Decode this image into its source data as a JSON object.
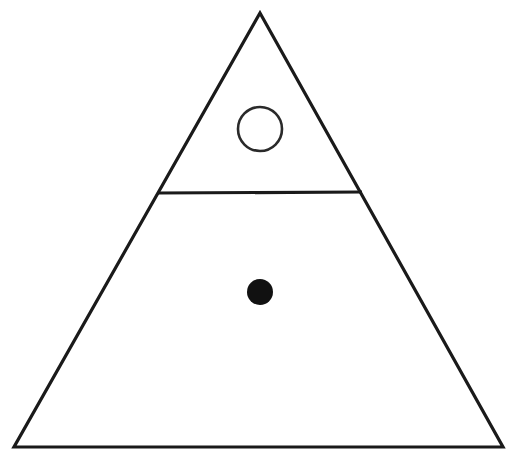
{
  "figure": {
    "name": "triangle-with-circles-diagram",
    "background_color": "#ffffff",
    "width": 518,
    "height": 468,
    "stroke_color": "#1a1a1a",
    "fill_color": "#111111"
  },
  "shapes": {
    "triangle": {
      "label": "outer-triangle",
      "apex_x": 260,
      "apex_y": 13,
      "bottom_left_x": 14,
      "bottom_left_y": 447,
      "bottom_right_x": 503,
      "bottom_right_y": 447,
      "stroke_width": 3.2,
      "fill": "none",
      "stroke": "#1a1a1a"
    },
    "divider": {
      "label": "horizontal-divider-line",
      "x1": 158,
      "y1": 193,
      "x2": 362,
      "y2": 192,
      "stroke_width": 3.2,
      "stroke": "#1a1a1a"
    },
    "open_circle": {
      "label": "open-circle-upper",
      "cx": 260,
      "cy": 129,
      "r": 22,
      "stroke_width": 2.6,
      "fill": "none",
      "stroke": "#2a2a2a"
    },
    "filled_dot": {
      "label": "filled-dot-lower",
      "cx": 260,
      "cy": 292,
      "r": 13,
      "fill": "#111111",
      "stroke": "none"
    }
  },
  "chart_data": {
    "type": "diagram",
    "title": "",
    "elements": [
      {
        "id": "outer-triangle",
        "kind": "polygon",
        "points": [
          [
            260,
            13
          ],
          [
            503,
            447
          ],
          [
            14,
            447
          ]
        ],
        "fill": "none",
        "stroke": "#1a1a1a",
        "stroke_width": 3.2
      },
      {
        "id": "horizontal-divider-line",
        "kind": "line",
        "points": [
          [
            158,
            193
          ],
          [
            362,
            192
          ]
        ],
        "stroke": "#1a1a1a",
        "stroke_width": 3.2
      },
      {
        "id": "open-circle-upper",
        "kind": "circle",
        "center": [
          260,
          129
        ],
        "radius": 22,
        "fill": "none",
        "stroke": "#2a2a2a",
        "stroke_width": 2.6
      },
      {
        "id": "filled-dot-lower",
        "kind": "circle",
        "center": [
          260,
          292
        ],
        "radius": 13,
        "fill": "#111111",
        "stroke": "none"
      }
    ],
    "regions": [
      {
        "id": "upper-region",
        "shape": "triangle",
        "contains": "open-circle-upper"
      },
      {
        "id": "lower-region",
        "shape": "trapezoid",
        "contains": "filled-dot-lower"
      }
    ],
    "xlim": [
      0,
      518
    ],
    "ylim": [
      0,
      468
    ],
    "grid": false,
    "legend": null
  }
}
